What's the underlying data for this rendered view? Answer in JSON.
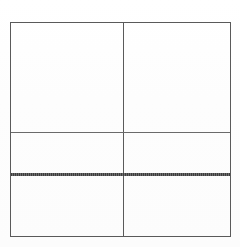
{
  "document": {
    "type": "table",
    "title": "",
    "background_color": "#fefefe",
    "note": ""
  },
  "table": {
    "border_color": "#5a5a5a",
    "rule_color_thin": "#6a6a6a",
    "rule_color_thick": "#4a4a4a",
    "columns": 2,
    "rows": 3,
    "column_headers": [
      "",
      ""
    ],
    "rows_data": [
      [
        "",
        ""
      ],
      [
        "",
        ""
      ],
      [
        "",
        ""
      ]
    ],
    "rules": [
      {
        "style": "thin",
        "label": ""
      },
      {
        "style": "thick",
        "label": ""
      }
    ]
  }
}
